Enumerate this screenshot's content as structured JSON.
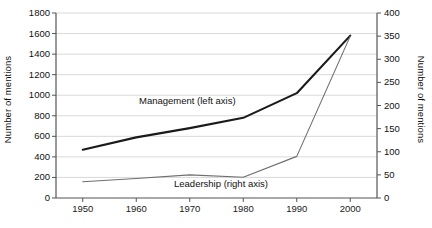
{
  "chart_data": {
    "type": "line",
    "title": "",
    "xlabel": "",
    "ylabel": "Number of mentions",
    "ylabel_right": "Number of mentions",
    "x": [
      1950,
      1960,
      1970,
      1980,
      1990,
      2000
    ],
    "xticklabels": [
      "1950",
      "1960",
      "1970",
      "1980",
      "1990",
      "2000"
    ],
    "xlim": [
      1945,
      2005
    ],
    "ylim": [
      0,
      1800
    ],
    "ylim_right": [
      0,
      400
    ],
    "yticks": [
      0,
      200,
      400,
      600,
      800,
      1000,
      1200,
      1400,
      1600,
      1800
    ],
    "yticklabels": [
      "0",
      "200",
      "400",
      "600",
      "800",
      "1000",
      "1200",
      "1400",
      "1600",
      "1800"
    ],
    "yticks_right": [
      0,
      50,
      100,
      150,
      200,
      250,
      300,
      350,
      400
    ],
    "yticklabels_right": [
      "0",
      "50",
      "100",
      "150",
      "200",
      "250",
      "300",
      "350",
      "400"
    ],
    "grid": true,
    "grid_color": "#c9c9c9",
    "legend_position": "inline-annotations",
    "series": [
      {
        "name": "Management (left axis)",
        "axis": "left",
        "color": "#1a1a1a",
        "linewidth": 2.1,
        "values": [
          470,
          590,
          680,
          780,
          1020,
          1580
        ]
      },
      {
        "name": "Leadership (right axis)",
        "axis": "right",
        "color": "#6e6e6e",
        "linewidth": 1.1,
        "values": [
          35,
          42,
          50,
          45,
          90,
          350
        ]
      }
    ],
    "annotations": [
      {
        "text": "Management (left axis)",
        "x": 1960,
        "y": 1020
      },
      {
        "text": "Leadership (right axis)",
        "x": 1973,
        "y": 180
      }
    ]
  },
  "axes": {
    "left_title": "Number of mentions",
    "right_title": "Number of mentions"
  },
  "series_labels": {
    "management": "Management (left axis)",
    "leadership": "Leadership (right axis)"
  }
}
